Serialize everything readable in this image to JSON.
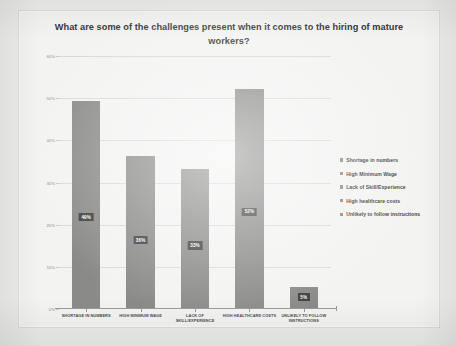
{
  "slide": {
    "title": "What are some of the challenges present when it comes to the hiring of mature workers?"
  },
  "colors": {
    "bar": "#8a8a88",
    "gridline": "#d9d9d7",
    "axis": "#9a9a98",
    "title_text": "#3a3a3a",
    "label_bg": "#3f3f3f",
    "label_text": "#ffffff",
    "slide_background": "#f3f3f2",
    "page_background": "#ececeb"
  },
  "chart_data": {
    "type": "bar",
    "title": "What are some of the challenges present when it comes to the hiring of mature workers?",
    "xlabel": "",
    "ylabel": "",
    "ylim": [
      0,
      60
    ],
    "ytick_labels": [
      "60%",
      "50%",
      "40%",
      "30%",
      "20%",
      "10%",
      "0%"
    ],
    "ytick_values": [
      60,
      50,
      40,
      30,
      20,
      10,
      0
    ],
    "grid": true,
    "legend_position": "right",
    "categories": [
      "SHORTAGE IN NUMBERS",
      "HIGH MINIMUM WAGE",
      "LACK OF SKILL/EXPERIENCE",
      "HIGH HEALTHCARE COSTS",
      "UNLIKELY TO FOLLOW\nINSTRUCTIONS"
    ],
    "values": [
      49,
      36,
      33,
      52,
      5
    ],
    "data_labels": [
      "49%",
      "36%",
      "33%",
      "52%",
      "5%"
    ],
    "legend": [
      "Shortage in numbers",
      "High Minimum Wage",
      "Lack of Skill/Experience",
      "High healthcare costs",
      "Unlikely to follow instructions"
    ]
  }
}
